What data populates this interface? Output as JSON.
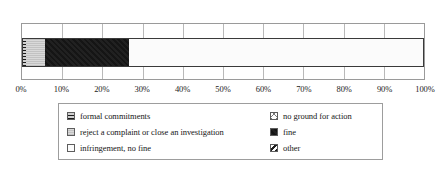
{
  "chart_data": {
    "type": "bar",
    "orientation": "horizontal",
    "stacked": true,
    "normalized": "100%",
    "title": "",
    "subtitle": "",
    "xlabel": "",
    "ylabel": "",
    "categories": [
      ""
    ],
    "xlim": [
      0,
      100
    ],
    "xticks": [
      0,
      10,
      20,
      30,
      40,
      50,
      60,
      70,
      80,
      90,
      100
    ],
    "xticklabels": [
      "0%",
      "10%",
      "20%",
      "30%",
      "40%",
      "50%",
      "60%",
      "70%",
      "80%",
      "90%",
      "100%"
    ],
    "grid": true,
    "grid_axis": "x",
    "legend_position": "bottom",
    "legend_columns": 2,
    "series": [
      {
        "name": "formal commitments",
        "values": [
          1.0
        ],
        "swatch": "dark-hatched",
        "color": "#3f3f3f"
      },
      {
        "name": "reject a complaint or close an investigation",
        "values": [
          4.7
        ],
        "swatch": "light-gray",
        "color": "#cfcfcf"
      },
      {
        "name": "fine",
        "values": [
          20.8
        ],
        "swatch": "solid-black",
        "color": "#151515"
      },
      {
        "name": "infringement, no fine",
        "values": [
          73.5
        ],
        "swatch": "white-dotted",
        "color": "#fbfbfb"
      },
      {
        "name": "no ground for action",
        "values": [
          0
        ],
        "swatch": "cross-hatched",
        "color": "#ffffff"
      },
      {
        "name": "other",
        "values": [
          0
        ],
        "swatch": "diagonal-hatched",
        "color": "#ffffff"
      }
    ]
  },
  "axis": {
    "ticks": [
      {
        "label": "0%",
        "value": 0
      },
      {
        "label": "10%",
        "value": 10
      },
      {
        "label": "20%",
        "value": 20
      },
      {
        "label": "30%",
        "value": 30
      },
      {
        "label": "40%",
        "value": 40
      },
      {
        "label": "50%",
        "value": 50
      },
      {
        "label": "60%",
        "value": 60
      },
      {
        "label": "70%",
        "value": 70
      },
      {
        "label": "80%",
        "value": 80
      },
      {
        "label": "90%",
        "value": 90
      },
      {
        "label": "100%",
        "value": 100
      }
    ]
  },
  "legend": {
    "entries": [
      {
        "label": "formal commitments",
        "fill": "formal",
        "column": 0,
        "row": 0
      },
      {
        "label": "no ground for action",
        "fill": "noground",
        "column": 1,
        "row": 0
      },
      {
        "label": "reject a complaint or close an investigation",
        "fill": "reject",
        "column": 0,
        "row": 1
      },
      {
        "label": "fine",
        "fill": "fine",
        "column": 1,
        "row": 1
      },
      {
        "label": "infringement, no fine",
        "fill": "infringement",
        "column": 0,
        "row": 2
      },
      {
        "label": "other",
        "fill": "other",
        "column": 1,
        "row": 2
      }
    ]
  }
}
